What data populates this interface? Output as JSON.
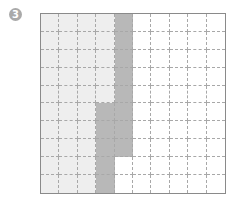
{
  "label": "3",
  "grid": {
    "rows": 10,
    "cols": 10,
    "colors": {
      "light": "#eeeeee",
      "dark": "#b8b8b8",
      "white": "#ffffff"
    },
    "cells": [
      [
        "light",
        "light",
        "light",
        "light",
        "dark",
        "white",
        "white",
        "white",
        "white",
        "white"
      ],
      [
        "light",
        "light",
        "light",
        "light",
        "dark",
        "white",
        "white",
        "white",
        "white",
        "white"
      ],
      [
        "light",
        "light",
        "light",
        "light",
        "dark",
        "white",
        "white",
        "white",
        "white",
        "white"
      ],
      [
        "light",
        "light",
        "light",
        "light",
        "dark",
        "white",
        "white",
        "white",
        "white",
        "white"
      ],
      [
        "light",
        "light",
        "light",
        "light",
        "dark",
        "white",
        "white",
        "white",
        "white",
        "white"
      ],
      [
        "light",
        "light",
        "light",
        "dark",
        "dark",
        "white",
        "white",
        "white",
        "white",
        "white"
      ],
      [
        "light",
        "light",
        "light",
        "dark",
        "dark",
        "white",
        "white",
        "white",
        "white",
        "white"
      ],
      [
        "light",
        "light",
        "light",
        "dark",
        "dark",
        "white",
        "white",
        "white",
        "white",
        "white"
      ],
      [
        "light",
        "light",
        "light",
        "dark",
        "white",
        "white",
        "white",
        "white",
        "white",
        "white"
      ],
      [
        "light",
        "light",
        "light",
        "dark",
        "white",
        "white",
        "white",
        "white",
        "white",
        "white"
      ]
    ]
  }
}
